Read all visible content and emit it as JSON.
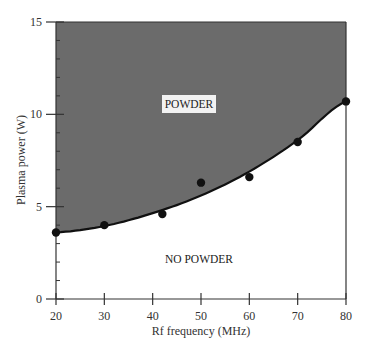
{
  "chart_data": {
    "type": "scatter",
    "title": "",
    "xlabel": "Rf frequency (MHz)",
    "ylabel": "Plasma power (W)",
    "xlim": [
      20,
      80
    ],
    "ylim": [
      0,
      15
    ],
    "x_ticks": [
      "20",
      "30",
      "40",
      "50",
      "60",
      "70",
      "80"
    ],
    "y_ticks": [
      "0",
      "5",
      "10",
      "15"
    ],
    "grid": false,
    "legend": null,
    "series": [
      {
        "name": "Measured threshold",
        "x": [
          20,
          30,
          42,
          50,
          60,
          70,
          80
        ],
        "y": [
          3.6,
          4.0,
          4.6,
          6.3,
          6.6,
          8.5,
          10.7
        ]
      },
      {
        "name": "Fit curve",
        "type": "line",
        "x": [
          20,
          30,
          40,
          50,
          60,
          70,
          80
        ],
        "y": [
          3.6,
          3.95,
          4.65,
          5.6,
          6.9,
          8.6,
          10.7
        ]
      }
    ],
    "annotations": [
      {
        "text": "POWDER",
        "region": "above curve (shaded gray)"
      },
      {
        "text": "NO POWDER",
        "region": "below curve"
      }
    ]
  },
  "labels": {
    "powder": "POWDER",
    "no_powder": "NO POWDER"
  },
  "colors": {
    "shaded_region": "#6b6b6b",
    "axis": "#333333",
    "points": "#111111"
  }
}
